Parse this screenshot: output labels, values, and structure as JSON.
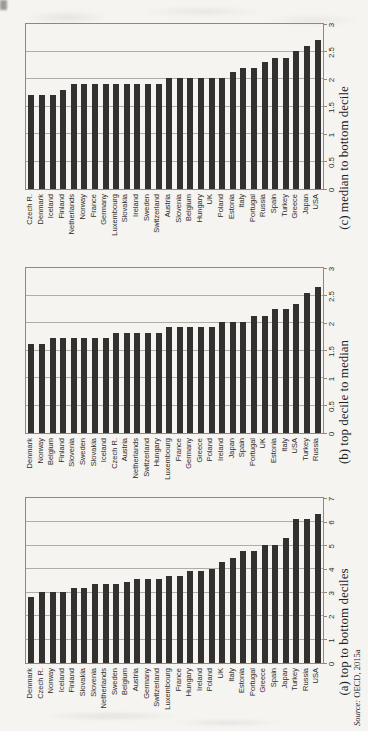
{
  "figure": {
    "bg_color": "#f5f4f1",
    "bar_color": "#32312f",
    "frame_color": "#8c8984",
    "grid_color": "#b0ada7",
    "text_color": "#2e2c29"
  },
  "source_note": {
    "prefix": "Source:",
    "text": " OECD, 2015a"
  },
  "chart_data": [
    {
      "type": "bar",
      "orientation": "panel rotated 90deg CCW on page; bars read as horizontal bars after rotating page clockwise",
      "caption": "(a) top to bottom deciles",
      "xlabel": "",
      "ylabel": "",
      "xlim": [
        0,
        7
      ],
      "grid": true,
      "tick_labels": [
        "0",
        "1",
        "2",
        "3",
        "4",
        "5",
        "6",
        "7"
      ],
      "categories": [
        "Denmark",
        "Czech R.",
        "Norway",
        "Iceland",
        "Finland",
        "Slovakia",
        "Slovenia",
        "Netherlands",
        "Sweden",
        "Belgium",
        "Austria",
        "Germany",
        "Switzerland",
        "Luxembourg",
        "France",
        "Hungary",
        "Ireland",
        "Poland",
        "UK",
        "Italy",
        "Estonia",
        "Portugal",
        "Greece",
        "Spain",
        "Japan",
        "Turkey",
        "Russia",
        "USA"
      ],
      "values": [
        2.8,
        3.0,
        3.0,
        3.0,
        3.2,
        3.2,
        3.35,
        3.35,
        3.35,
        3.45,
        3.55,
        3.55,
        3.55,
        3.7,
        3.7,
        3.9,
        3.9,
        4.0,
        4.3,
        4.45,
        4.75,
        4.75,
        5.0,
        5.0,
        5.3,
        6.1,
        6.1,
        6.3
      ]
    },
    {
      "type": "bar",
      "orientation": "panel rotated 90deg CCW on page; bars read as horizontal bars after rotating page clockwise",
      "caption": "(b) top decile to median",
      "xlabel": "",
      "ylabel": "",
      "xlim": [
        0,
        3
      ],
      "grid": true,
      "tick_labels": [
        "0",
        "0.5",
        "1",
        "1.5",
        "2",
        "2.5",
        "3"
      ],
      "categories": [
        "Denmark",
        "Norway",
        "Belgium",
        "Finland",
        "Slovenia",
        "Sweden",
        "Slovakia",
        "Iceland",
        "Czech R.",
        "Austria",
        "Netherlands",
        "Switzerland",
        "Hungary",
        "Luxembourg",
        "France",
        "Germany",
        "Greece",
        "Poland",
        "Ireland",
        "Japan",
        "Spain",
        "Portugal",
        "UK",
        "Estonia",
        "Italy",
        "USA",
        "Turkey",
        "Russia"
      ],
      "values": [
        1.62,
        1.62,
        1.72,
        1.72,
        1.72,
        1.72,
        1.72,
        1.72,
        1.82,
        1.82,
        1.82,
        1.82,
        1.82,
        1.93,
        1.93,
        1.93,
        1.93,
        1.93,
        2.02,
        2.02,
        2.02,
        2.13,
        2.13,
        2.25,
        2.25,
        2.35,
        2.55,
        2.65
      ]
    },
    {
      "type": "bar",
      "orientation": "panel rotated 90deg CCW on page; bars read as horizontal bars after rotating page clockwise",
      "caption": "(c) median to bottom decile",
      "xlabel": "",
      "ylabel": "",
      "xlim": [
        0,
        3
      ],
      "grid": true,
      "tick_labels": [
        "0",
        "0.5",
        "1",
        "1.5",
        "2",
        "2.5",
        "3"
      ],
      "categories": [
        "Czech R.",
        "Denmark",
        "Iceland",
        "Finland",
        "Netherlands",
        "Norway",
        "France",
        "Germany",
        "Luxembourg",
        "Slovakia",
        "Ireland",
        "Sweden",
        "Switzerland",
        "Austria",
        "Slovenia",
        "Belgium",
        "Hungary",
        "UK",
        "Poland",
        "Estonia",
        "Italy",
        "Portugal",
        "Russia",
        "Spain",
        "Turkey",
        "Greece",
        "Japan",
        "USA"
      ],
      "values": [
        1.7,
        1.7,
        1.7,
        1.8,
        1.9,
        1.9,
        1.9,
        1.9,
        1.9,
        1.9,
        1.9,
        1.9,
        1.9,
        2.02,
        2.02,
        2.02,
        2.02,
        2.02,
        2.02,
        2.12,
        2.2,
        2.2,
        2.3,
        2.38,
        2.38,
        2.5,
        2.6,
        2.7
      ]
    }
  ]
}
